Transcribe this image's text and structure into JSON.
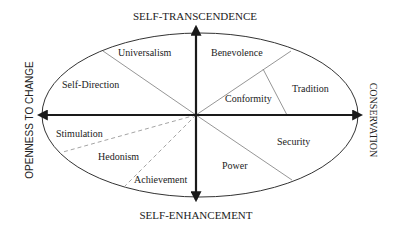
{
  "diagram": {
    "axes": {
      "top": "SELF-TRANSCENDENCE",
      "bottom": "SELF-ENHANCEMENT",
      "left": "OPENNESS TO CHANGE",
      "right": "CONSERVATION"
    },
    "values": [
      {
        "label": "Universalism"
      },
      {
        "label": "Benevolence"
      },
      {
        "label": "Self-Direction"
      },
      {
        "label": "Tradition"
      },
      {
        "label": "Conformity"
      },
      {
        "label": "Stimulation"
      },
      {
        "label": "Security"
      },
      {
        "label": "Hedonism"
      },
      {
        "label": "Power"
      },
      {
        "label": "Achievement"
      }
    ],
    "colors": {
      "axis": "#1a1a1a",
      "ellipse": "#333333",
      "divider": "#8a8a8a",
      "dashed_divider": "#9a9a9a",
      "text": "#222222"
    }
  }
}
